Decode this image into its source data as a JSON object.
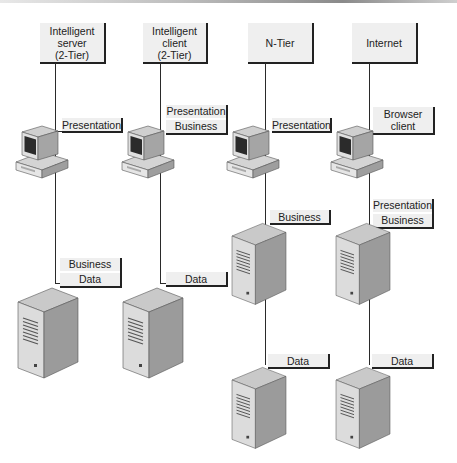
{
  "diagram": {
    "type": "architecture-tiers",
    "columns": [
      {
        "title_lines": [
          "Intelligent",
          "server",
          "(2-Tier)"
        ],
        "client_labels": [
          "Presentation"
        ],
        "servers": [
          {
            "labels": [
              "Business",
              "Data"
            ]
          }
        ]
      },
      {
        "title_lines": [
          "Intelligent",
          "client",
          "(2-Tier)"
        ],
        "client_labels": [
          "Presentation",
          "Business"
        ],
        "servers": [
          {
            "labels": [
              "Data"
            ]
          }
        ]
      },
      {
        "title_lines": [
          "N-Tier"
        ],
        "client_labels": [
          "Presentation"
        ],
        "servers": [
          {
            "labels": [
              "Business"
            ]
          },
          {
            "labels": [
              "Data"
            ]
          }
        ]
      },
      {
        "title_lines": [
          "Internet"
        ],
        "client_labels": [
          "Browser client"
        ],
        "client_label_lines": [
          "Browser",
          "client"
        ],
        "servers": [
          {
            "labels": [
              "Presentation",
              "Business"
            ]
          },
          {
            "labels": [
              "Data"
            ]
          }
        ]
      }
    ]
  },
  "colors": {
    "label_bg": "#efefef",
    "line": "#2a2a2a",
    "server_front": "#d9d9d9",
    "server_side": "#9a9a9a",
    "server_top": "#c8c8c8"
  }
}
